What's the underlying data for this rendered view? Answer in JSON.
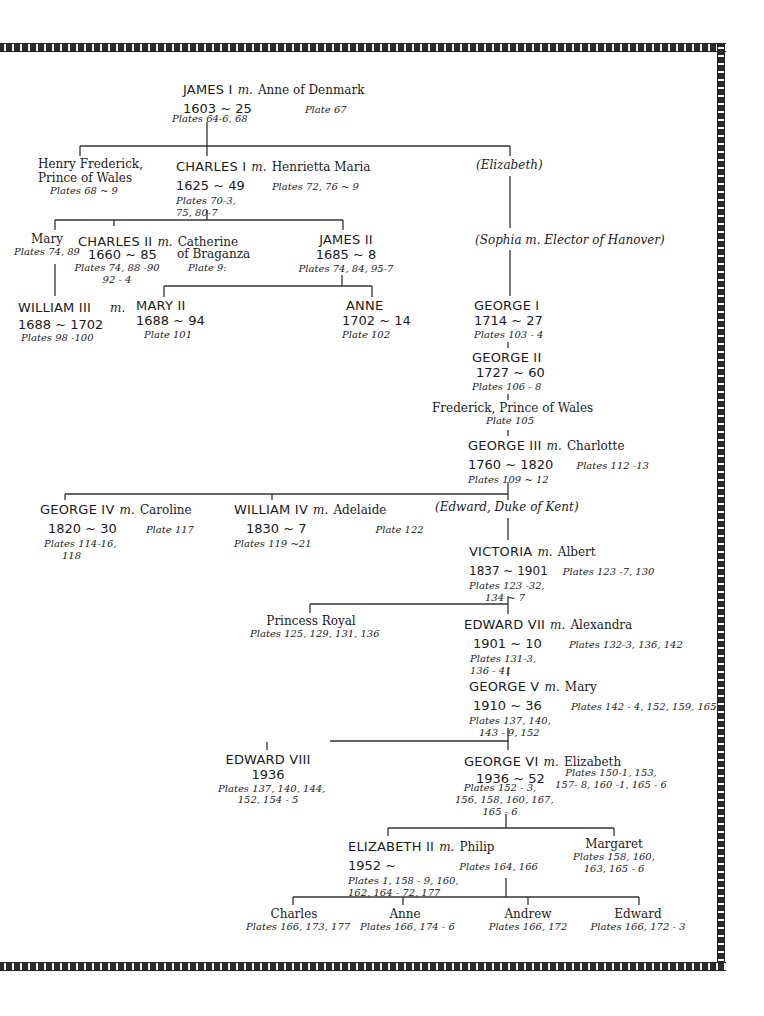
{
  "marriage_marker": "m.",
  "people": {
    "james1": {
      "name": "JAMES I",
      "spouse": "Anne of Denmark",
      "dates": "1603 ~ 25",
      "plates": "Plates 64-6, 68",
      "spouse_plates": "Plate 67"
    },
    "henry": {
      "name_line1": "Henry Frederick,",
      "name_line2": "Prince of Wales",
      "plates": "Plates 68 ~ 9"
    },
    "charles1": {
      "name": "CHARLES I",
      "spouse": "Henrietta Maria",
      "dates": "1625 ~ 49",
      "plates_line1": "Plates 70-3,",
      "plates_line2": "75, 80-7",
      "spouse_plates": "Plates 72, 76 ~ 9"
    },
    "elizabeth_p": {
      "name": "(Elizabeth)"
    },
    "sophia": {
      "name": "(Sophia m. Elector of Hanover)"
    },
    "mary": {
      "name": "Mary",
      "plates": "Plates 74, 89"
    },
    "charles2": {
      "name": "CHARLES II",
      "spouse_line1": "Catherine",
      "spouse_line2": "of Braganza",
      "dates": "1660 ~ 85",
      "plates_line1": "Plates 74, 88 -90",
      "plates_line2": "92 - 4",
      "spouse_plates": "Plate 9:"
    },
    "james2": {
      "name": "JAMES II",
      "dates": "1685 ~ 8",
      "plates": "Plates 74, 84, 95-7"
    },
    "william3": {
      "name": "WILLIAM III",
      "dates": "1688 ~ 1702",
      "plates": "Plates 98 -100"
    },
    "mary2": {
      "name": "MARY II",
      "dates": "1688 ~ 94",
      "plates": "Plate 101"
    },
    "anne": {
      "name": "ANNE",
      "dates": "1702 ~ 14",
      "plates": "Plate 102"
    },
    "george1": {
      "name": "GEORGE I",
      "dates": "1714 ~ 27",
      "plates": "Plates 103 - 4"
    },
    "george2": {
      "name": "GEORGE II",
      "dates": "1727 ~ 60",
      "plates": "Plates 106 - 8"
    },
    "frederick": {
      "name": "Frederick, Prince of Wales",
      "plates": "Plate 105"
    },
    "george3": {
      "name": "GEORGE III",
      "spouse": "Charlotte",
      "dates": "1760 ~ 1820",
      "plates": "Plates 109 ~ 12",
      "spouse_plates": "Plates 112 -13"
    },
    "george4": {
      "name": "GEORGE IV",
      "spouse": "Caroline",
      "dates": "1820 ~ 30",
      "plates_line1": "Plates 114-16,",
      "plates_line2": "118",
      "spouse_plates": "Plate 117"
    },
    "william4": {
      "name": "WILLIAM IV",
      "spouse": "Adelaide",
      "dates": "1830 ~ 7",
      "plates": "Plates 119 ~21",
      "spouse_plates": "Plate 122"
    },
    "edward_kent": {
      "name": "(Edward, Duke of Kent)"
    },
    "victoria": {
      "name": "VICTORIA",
      "spouse": "Albert",
      "dates": "1837 ~ 1901",
      "plates_line1": "Plates 123 -32,",
      "plates_line2": "134 ~ 7",
      "spouse_plates": "Plates 123 -7, 130"
    },
    "princess_royal": {
      "name": "Princess Royal",
      "plates": "Plates 125, 129, 131, 136"
    },
    "edward7": {
      "name": "EDWARD VII",
      "spouse": "Alexandra",
      "dates": "1901 ~ 10",
      "plates_line1": "Plates 131-3,",
      "plates_line2": "136 - 41",
      "spouse_plates": "Plates 132-3, 136, 142"
    },
    "george5": {
      "name": "GEORGE V",
      "spouse": "Mary",
      "dates": "1910 ~ 36",
      "plates_line1": "Plates 137, 140,",
      "plates_line2": "143 - 9, 152",
      "spouse_plates": "Plates 142 - 4, 152, 159, 165"
    },
    "edward8": {
      "name": "EDWARD VIII",
      "dates": "1936",
      "plates_line1": "Plates 137, 140, 144,",
      "plates_line2": "152, 154 - 5"
    },
    "george6": {
      "name": "GEORGE VI",
      "spouse": "Elizabeth",
      "dates": "1936 ~ 52",
      "plates_line1": "Plates 152 - 3,",
      "plates_line2": "156, 158, 160, 167,",
      "plates_line3": "165 - 6",
      "spouse_plates_line1": "Plates 150-1, 153,",
      "spouse_plates_line2": "157- 8, 160 -1, 165 - 6"
    },
    "elizabeth2": {
      "name": "ELIZABETH II",
      "spouse": "Philip",
      "dates": "1952 ~",
      "plates_line1": "Plates 1, 158 - 9, 160,",
      "plates_line2": "162, 164 - 72, 177",
      "spouse_plates": "Plates 164, 166"
    },
    "margaret": {
      "name": "Margaret",
      "plates_line1": "Plates 158, 160,",
      "plates_line2": "163, 165 - 6"
    },
    "charles": {
      "name": "Charles",
      "plates": "Plates 166, 173, 177"
    },
    "anne_p": {
      "name": "Anne",
      "plates": "Plates 166, 174 - 6"
    },
    "andrew": {
      "name": "Andrew",
      "plates": "Plates 166, 172"
    },
    "edward": {
      "name": "Edward",
      "plates": "Plates 166, 172 - 3"
    }
  },
  "colors": {
    "ink": "#1a1a1a",
    "border_dark": "#2a2a2a",
    "paper": "#ffffff"
  }
}
